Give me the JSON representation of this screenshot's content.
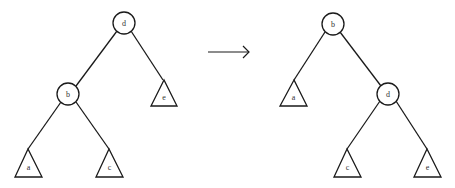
{
  "diagram": {
    "type": "tree-rotation",
    "arrow": {
      "direction": "right"
    },
    "before": {
      "nodes": [
        {
          "id": "d",
          "label": "d",
          "kind": "node"
        },
        {
          "id": "b",
          "label": "b",
          "kind": "node"
        },
        {
          "id": "a",
          "label": "a",
          "kind": "subtree"
        },
        {
          "id": "c",
          "label": "c",
          "kind": "subtree"
        },
        {
          "id": "e",
          "label": "e",
          "kind": "subtree"
        }
      ],
      "edges": [
        {
          "from": "d",
          "to": "b"
        },
        {
          "from": "d",
          "to": "e"
        },
        {
          "from": "b",
          "to": "a"
        },
        {
          "from": "b",
          "to": "c"
        }
      ]
    },
    "after": {
      "nodes": [
        {
          "id": "b",
          "label": "b",
          "kind": "node"
        },
        {
          "id": "d",
          "label": "d",
          "kind": "node"
        },
        {
          "id": "a",
          "label": "a",
          "kind": "subtree"
        },
        {
          "id": "c",
          "label": "c",
          "kind": "subtree"
        },
        {
          "id": "e",
          "label": "e",
          "kind": "subtree"
        }
      ],
      "edges": [
        {
          "from": "b",
          "to": "a"
        },
        {
          "from": "b",
          "to": "d"
        },
        {
          "from": "d",
          "to": "c"
        },
        {
          "from": "d",
          "to": "e"
        }
      ]
    }
  }
}
